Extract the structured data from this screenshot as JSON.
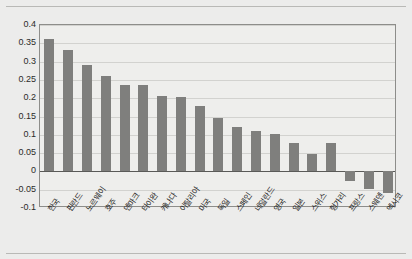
{
  "chart_data": {
    "type": "bar",
    "title": "",
    "subtitle": "",
    "xlabel": "",
    "ylabel": "",
    "ylim": [
      -0.1,
      0.4
    ],
    "yticks": [
      0.4,
      0.35,
      0.3,
      0.25,
      0.2,
      0.15,
      0.1,
      0.05,
      0,
      -0.05,
      -0.1
    ],
    "ytick_labels": [
      "0.4",
      "0.35",
      "0.3",
      "0.25",
      "0.2",
      "0.15",
      "0.1",
      "0.05",
      "0",
      "-0.05",
      "-0.1"
    ],
    "grid": true,
    "legend": false,
    "legend_position": "none",
    "bar_color": "#7f7f7d",
    "plot_background": "#eeeeec",
    "figure_background": "#ececeb",
    "zero_line": true,
    "categories": [
      "한국",
      "핀란드",
      "노르웨이",
      "호주",
      "덴마크",
      "타이완",
      "캐나다",
      "이탈리아",
      "미국",
      "독일",
      "스페인",
      "네덜란드",
      "영국",
      "일본",
      "스위스",
      "헝가리",
      "프랑스",
      "스웨덴",
      "멕시코"
    ],
    "values": [
      0.362,
      0.333,
      0.29,
      0.261,
      0.236,
      0.236,
      0.206,
      0.202,
      0.178,
      0.146,
      0.122,
      0.11,
      0.101,
      0.078,
      0.047,
      0.078,
      -0.027,
      -0.047,
      -0.058
    ]
  }
}
